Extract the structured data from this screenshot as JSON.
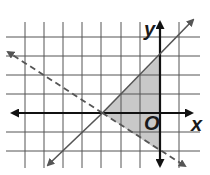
{
  "diagram": {
    "type": "coordinate-plane-inequality-graph",
    "axes": {
      "x_label": "x",
      "y_label": "y",
      "origin_label": "O"
    },
    "grid": {
      "x_range": [
        -7,
        1
      ],
      "y_range": [
        -2,
        4
      ],
      "unit": 1
    },
    "lines": [
      {
        "name": "solid-boundary",
        "style": "solid",
        "equation": "y = x + 3",
        "points": [
          [
            -3,
            0
          ],
          [
            0,
            3
          ]
        ]
      },
      {
        "name": "dashed-boundary",
        "style": "dashed",
        "equation": "y = -2/3 x - 2",
        "points": [
          [
            -3,
            0
          ],
          [
            0,
            -2
          ]
        ]
      }
    ],
    "shaded_region": {
      "vertices": [
        [
          -3,
          0
        ],
        [
          0,
          3
        ],
        [
          0,
          -2
        ]
      ],
      "color": "#c8c8c8"
    },
    "colors": {
      "grid": "#555555",
      "axis": "#111111",
      "line": "#555555",
      "shade": "#c8c8c8"
    }
  }
}
